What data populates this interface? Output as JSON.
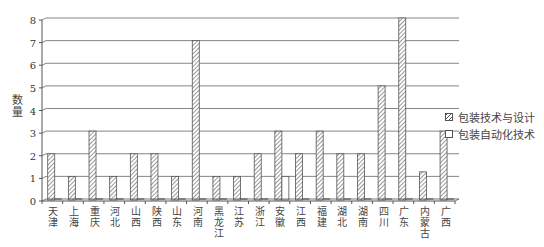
{
  "chart_data": {
    "type": "bar",
    "title": "",
    "xlabel": "",
    "ylabel": "数量",
    "ylim": [
      0,
      8
    ],
    "yticks": [
      0,
      1,
      2,
      3,
      4,
      5,
      6,
      7,
      8
    ],
    "grid": true,
    "legend_position": "right",
    "categories": [
      "天津",
      "上海",
      "重庆",
      "河北",
      "山西",
      "陕西",
      "山东",
      "河南",
      "黑龙江",
      "江苏",
      "浙江",
      "安徽",
      "江西",
      "福建",
      "湖北",
      "湖南",
      "四川",
      "广东",
      "内蒙古",
      "广西"
    ],
    "series": [
      {
        "name": "包装技术与设计",
        "pattern": "hatched",
        "values": [
          2,
          1,
          3,
          1,
          2,
          2,
          1,
          7,
          1,
          1,
          2,
          3,
          2,
          3,
          2,
          2,
          5,
          8,
          1.2,
          3
        ]
      },
      {
        "name": "包装自动化技术",
        "pattern": "plain",
        "values": [
          0,
          0,
          0,
          0,
          0,
          0,
          0,
          0,
          0,
          0,
          0,
          1,
          0,
          0,
          0,
          0,
          0,
          0,
          0,
          0
        ]
      }
    ]
  },
  "legend": {
    "items": [
      {
        "label": "包装技术与设计"
      },
      {
        "label": "包装自动化技术"
      }
    ]
  },
  "colors": {
    "axis": "#555555",
    "grid": "#666666",
    "bar_stroke": "#555555",
    "hatch": "#555555",
    "background": "#ffffff"
  }
}
